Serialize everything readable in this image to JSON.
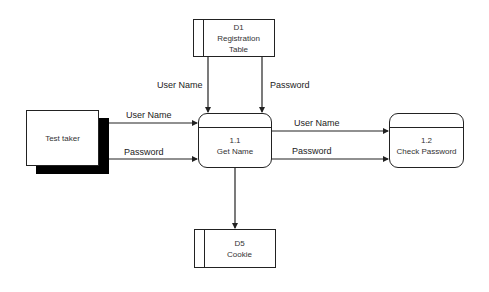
{
  "diagram": {
    "type": "data-flow-diagram",
    "entities": [
      {
        "id": "test-taker",
        "label": "Test taker"
      }
    ],
    "processes": [
      {
        "id": "p1_1",
        "number": "1.1",
        "label": "Get Name"
      },
      {
        "id": "p1_2",
        "number": "1.2",
        "label": "Check Password"
      }
    ],
    "data_stores": [
      {
        "id": "d1",
        "code": "D1",
        "label_line1": "Registration",
        "label_line2": "Table"
      },
      {
        "id": "d5",
        "code": "D5",
        "label": "Cookie"
      }
    ],
    "flows": [
      {
        "from": "test-taker",
        "to": "p1_1",
        "label": "User Name"
      },
      {
        "from": "test-taker",
        "to": "p1_1",
        "label": "Password"
      },
      {
        "from": "d1",
        "to": "p1_1",
        "label": "User Name"
      },
      {
        "from": "d1",
        "to": "p1_1",
        "label": "Password"
      },
      {
        "from": "p1_1",
        "to": "p1_2",
        "label": "User Name"
      },
      {
        "from": "p1_1",
        "to": "p1_2",
        "label": "Password"
      },
      {
        "from": "p1_1",
        "to": "d5",
        "label": ""
      }
    ],
    "colors": {
      "line": "#222222",
      "shadow": "#000000",
      "background": "#ffffff"
    }
  }
}
